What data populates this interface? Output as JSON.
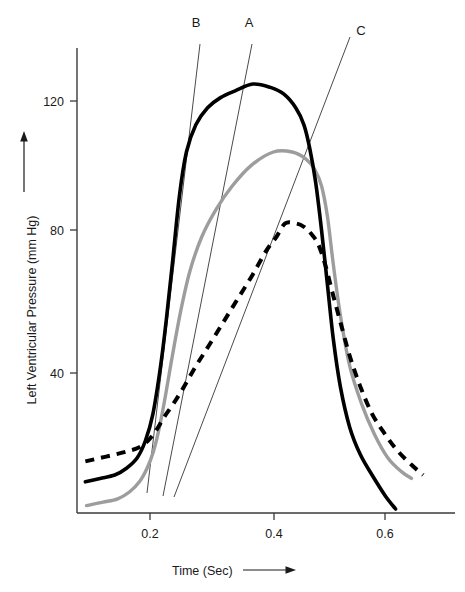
{
  "chart_data": {
    "type": "line",
    "title": "",
    "subtitle": "",
    "xlabel": "Time (Sec)",
    "ylabel": "Left Ventricular Pressure (mm Hg)",
    "xlim": [
      0.09,
      0.7
    ],
    "ylim": [
      0,
      133
    ],
    "grid": false,
    "legend_position": "none",
    "xticks": [
      0.2,
      0.4,
      0.6
    ],
    "xtick_labels": [
      "0.2",
      "0.4",
      "0.6"
    ],
    "yticks": [
      40,
      80,
      120
    ],
    "ytick_labels": [
      "40",
      "80",
      "120"
    ],
    "annotations": [
      {
        "label": "B",
        "x": 0.295,
        "y": 133,
        "description": "tangent-line-B"
      },
      {
        "label": "A",
        "x": 0.383,
        "y": 133,
        "description": "tangent-line-A"
      },
      {
        "label": "C",
        "x": 0.575,
        "y": 133,
        "description": "tangent-line-C"
      }
    ],
    "series": [
      {
        "name": "black-solid-pressure-curve",
        "style": "solid",
        "color": "#000000",
        "peak_value": 125,
        "peak_time": 0.375,
        "baseline_value": 8,
        "x": [
          0.09,
          0.115,
          0.14,
          0.16,
          0.178,
          0.192,
          0.205,
          0.218,
          0.228,
          0.238,
          0.25,
          0.262,
          0.278,
          0.298,
          0.32,
          0.345,
          0.375,
          0.405,
          0.428,
          0.448,
          0.462,
          0.472,
          0.482,
          0.492,
          0.502,
          0.512,
          0.524,
          0.54,
          0.558,
          0.578,
          0.6,
          0.618
        ],
        "y": [
          8,
          9,
          10,
          12,
          15,
          20,
          28,
          42,
          56,
          72,
          92,
          105,
          113,
          118,
          121,
          123,
          125,
          124,
          122,
          118,
          113,
          106,
          96,
          82,
          66,
          50,
          36,
          24,
          16,
          10,
          4,
          0
        ]
      },
      {
        "name": "gray-solid-pressure-curve",
        "style": "solid",
        "color": "#9d9d9d",
        "peak_value": 105,
        "peak_time": 0.41,
        "baseline_value": 1,
        "x": [
          0.092,
          0.12,
          0.145,
          0.165,
          0.182,
          0.195,
          0.206,
          0.216,
          0.226,
          0.238,
          0.252,
          0.268,
          0.288,
          0.312,
          0.34,
          0.372,
          0.41,
          0.442,
          0.465,
          0.48,
          0.492,
          0.502,
          0.512,
          0.524,
          0.54,
          0.56,
          0.582,
          0.605,
          0.628,
          0.645
        ],
        "y": [
          1,
          2,
          3,
          5,
          8,
          12,
          17,
          24,
          33,
          45,
          58,
          70,
          80,
          88,
          95,
          101,
          105,
          105,
          103,
          100,
          95,
          86,
          72,
          57,
          42,
          31,
          22,
          15,
          11,
          9
        ]
      },
      {
        "name": "black-dashed-pressure-curve",
        "style": "dashed",
        "color": "#000000",
        "peak_value": 84,
        "peak_time": 0.43,
        "baseline_value": 14,
        "x": [
          0.09,
          0.115,
          0.14,
          0.162,
          0.18,
          0.196,
          0.21,
          0.224,
          0.24,
          0.258,
          0.278,
          0.3,
          0.325,
          0.35,
          0.375,
          0.398,
          0.415,
          0.43,
          0.448,
          0.462,
          0.474,
          0.486,
          0.498,
          0.51,
          0.524,
          0.54,
          0.558,
          0.578,
          0.6,
          0.622,
          0.645,
          0.665
        ],
        "y": [
          14,
          15,
          16,
          17,
          18,
          20,
          23,
          27,
          31,
          36,
          42,
          48,
          55,
          62,
          69,
          76,
          80,
          84,
          84,
          83,
          81,
          78,
          72,
          64,
          55,
          45,
          36,
          28,
          22,
          17,
          13,
          10
        ]
      }
    ],
    "tangent_lines": [
      {
        "label": "B",
        "x1": 0.253,
        "y1": 131,
        "x2": 0.19,
        "y2": 2
      },
      {
        "label": "A",
        "x1": 0.336,
        "y1": 131,
        "x2": 0.216,
        "y2": 2
      },
      {
        "label": "C",
        "x1": 0.534,
        "y1": 127,
        "x2": 0.232,
        "y2": 2
      }
    ]
  },
  "axis": {
    "y_title": "Left Ventricular Pressure (mm Hg)",
    "x_title": "Time (Sec)",
    "y_ticks": [
      "120",
      "80",
      "40"
    ],
    "x_ticks": [
      "0.2",
      "0.4",
      "0.6"
    ],
    "y_arrow_name": "y-axis-direction-arrow",
    "x_arrow_name": "x-axis-direction-arrow"
  },
  "labels": {
    "b": "B",
    "a": "A",
    "c": "C"
  }
}
